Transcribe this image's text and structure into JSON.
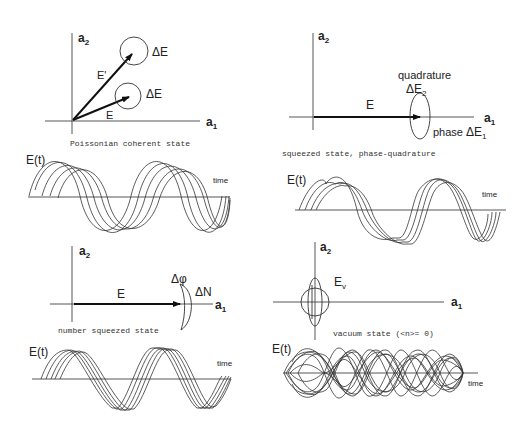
{
  "figure": {
    "panels": [
      {
        "id": "poissonian",
        "caption": "Poissonian coherent state",
        "axis_x": "a",
        "axis_x_sub": "1",
        "axis_y": "a",
        "axis_y_sub": "2",
        "vectors": [
          {
            "label": "E'",
            "uncertainty_label": "ΔE"
          },
          {
            "label": "E",
            "uncertainty_label": "ΔE"
          }
        ],
        "waveform": {
          "ylabel": "E(t)",
          "xlabel": "time",
          "traces": 5
        }
      },
      {
        "id": "phase_quadrature_squeezed",
        "caption": "squeezed state, phase-quadrature",
        "axis_x": "a",
        "axis_x_sub": "1",
        "axis_y": "a",
        "axis_y_sub": "2",
        "vector_label": "E",
        "quadrature_label": "quadrature",
        "delta_e2": "ΔE",
        "delta_e2_sub": "2",
        "phase_label": "phase",
        "delta_e1": "ΔE",
        "delta_e1_sub": "1",
        "waveform": {
          "ylabel": "E(t)",
          "xlabel": "time",
          "traces": 4
        }
      },
      {
        "id": "number_squeezed",
        "caption": "number squeezed state",
        "axis_x": "a",
        "axis_x_sub": "1",
        "axis_y": "a",
        "axis_y_sub": "2",
        "vector_label": "E",
        "delta_phi": "Δφ",
        "delta_n": "ΔN",
        "waveform": {
          "ylabel": "E(t)",
          "xlabel": "time",
          "traces": 5
        }
      },
      {
        "id": "vacuum",
        "caption": "vacuum state (<n>= 0)",
        "axis_x": "a",
        "axis_x_sub": "1",
        "axis_y": "a",
        "axis_y_sub": "2",
        "field_label": "E",
        "field_sub": "v",
        "waveform": {
          "ylabel": "E(t)",
          "xlabel": "time",
          "traces": 12
        }
      }
    ],
    "colors": {
      "ink": "#222222",
      "background": "#ffffff"
    }
  }
}
